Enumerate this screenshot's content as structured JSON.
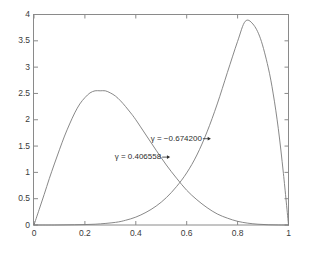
{
  "chart_data": {
    "type": "line",
    "title": "",
    "xlabel": "",
    "ylabel": "",
    "xlim": [
      0,
      1
    ],
    "ylim": [
      0,
      4
    ],
    "grid": false,
    "legend": null,
    "x_ticks": [
      "0",
      "0.2",
      "0.4",
      "0.6",
      "0.8",
      "1"
    ],
    "x_tick_values": [
      0,
      0.2,
      0.4,
      0.6,
      0.8,
      1
    ],
    "y_ticks": [
      "0",
      "0.5",
      "1",
      "1.5",
      "2",
      "2.5",
      "3",
      "3.5",
      "4"
    ],
    "y_tick_values": [
      0,
      0.5,
      1,
      1.5,
      2,
      2.5,
      3,
      3.5,
      4
    ],
    "line_color": "#7a7a7a",
    "axis_color": "#8a8a8a",
    "background": "#ffffff",
    "series": [
      {
        "name": "left-curve",
        "peak_x": 0.28,
        "peak_y": 2.55,
        "x": [
          0.0,
          0.02,
          0.04,
          0.06,
          0.08,
          0.1,
          0.12,
          0.14,
          0.16,
          0.18,
          0.2,
          0.22,
          0.24,
          0.26,
          0.28,
          0.3,
          0.32,
          0.34,
          0.36,
          0.38,
          0.4,
          0.44,
          0.48,
          0.52,
          0.56,
          0.6,
          0.64,
          0.68,
          0.72,
          0.76,
          0.8,
          0.84,
          0.88,
          0.92,
          0.96,
          1.0
        ],
        "y": [
          0.0,
          0.29,
          0.58,
          0.88,
          1.16,
          1.43,
          1.69,
          1.92,
          2.13,
          2.3,
          2.42,
          2.51,
          2.55,
          2.55,
          2.55,
          2.51,
          2.45,
          2.36,
          2.25,
          2.13,
          2.0,
          1.71,
          1.42,
          1.14,
          0.89,
          0.66,
          0.48,
          0.33,
          0.21,
          0.13,
          0.07,
          0.035,
          0.015,
          0.005,
          0.001,
          0.0
        ]
      },
      {
        "name": "right-curve",
        "peak_x": 0.83,
        "peak_y": 3.87,
        "x": [
          0.0,
          0.08,
          0.16,
          0.24,
          0.32,
          0.36,
          0.4,
          0.44,
          0.48,
          0.52,
          0.56,
          0.6,
          0.64,
          0.68,
          0.72,
          0.76,
          0.8,
          0.83,
          0.86,
          0.89,
          0.92,
          0.94,
          0.96,
          0.98,
          1.0
        ],
        "y": [
          0.0,
          0.0,
          0.005,
          0.015,
          0.05,
          0.09,
          0.15,
          0.24,
          0.36,
          0.52,
          0.73,
          0.99,
          1.33,
          1.77,
          2.3,
          2.9,
          3.49,
          3.87,
          3.82,
          3.54,
          3.0,
          2.49,
          1.83,
          0.98,
          0.0
        ]
      }
    ],
    "annotations": [
      {
        "name": "gamma-negative",
        "text": "γ = −0.674200",
        "target_series": "right-curve",
        "arrow_direction": "right"
      },
      {
        "name": "gamma-positive",
        "text": "γ = 0.406558",
        "target_series": "left-curve",
        "arrow_direction": "right"
      }
    ]
  }
}
